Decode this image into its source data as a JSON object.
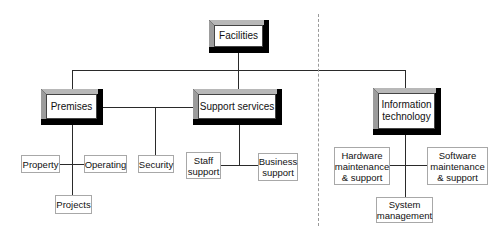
{
  "diagram": {
    "type": "org-chart",
    "root": {
      "label": "Facilities"
    },
    "divisions": [
      {
        "label": "Premises",
        "children": [
          "Property",
          "Operating",
          "Projects",
          "Security"
        ]
      },
      {
        "label": "Support services",
        "children": [
          "Staff\nsupport",
          "Business\nsupport"
        ]
      },
      {
        "label": "Information\ntechnology",
        "children": [
          "Hardware\nmaintenance\n& support",
          "Software\nmaintenance\n& support",
          "System\nmanagement"
        ]
      }
    ],
    "separator": "dashed-vertical"
  },
  "nodes": {
    "facilities": "Facilities",
    "premises": "Premises",
    "support_services": "Support services",
    "information_technology": "Information\ntechnology",
    "property": "Property",
    "operating": "Operating",
    "projects": "Projects",
    "security": "Security",
    "staff_support": "Staff\nsupport",
    "business_support": "Business\nsupport",
    "hardware": "Hardware\nmaintenance\n& support",
    "software": "Software\nmaintenance\n& support",
    "system_management": "System\nmanagement"
  },
  "colors": {
    "line": "#2a2a2a",
    "bevel_shadow": "#000000",
    "bevel_top": "#b8b8b8",
    "bevel_left": "#9c9c9c",
    "leaf_border": "#a8a8a8",
    "separator": "#9a9a9a"
  }
}
